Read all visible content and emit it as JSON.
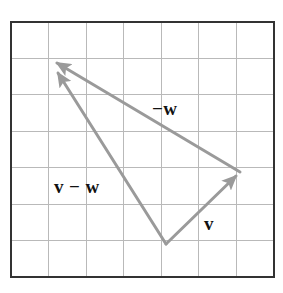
{
  "figure": {
    "background_color": "#ffffff"
  },
  "grid": {
    "x0": 11,
    "y0": 22,
    "x1": 274,
    "y1": 277,
    "columns": 7,
    "rows": 7,
    "border_color": "#333333",
    "border_width": 2,
    "line_color": "#b9b9b9",
    "line_width": 1,
    "fill_color": "#ffffff"
  },
  "vectors": {
    "color": "#9a9a9a",
    "line_width": 3,
    "items": [
      {
        "id": "v",
        "label": "v",
        "label_text": "v",
        "from": {
          "x": 166,
          "y": 244
        },
        "to": {
          "x": 240,
          "y": 172
        },
        "label_pos": {
          "x": 204,
          "y": 230
        }
      },
      {
        "id": "minus-w",
        "label": "−w",
        "label_text": "−w",
        "from": {
          "x": 240,
          "y": 172
        },
        "to": {
          "x": 52,
          "y": 60
        },
        "label_pos": {
          "x": 152,
          "y": 115
        }
      },
      {
        "id": "v-minus-w",
        "label": "v − w",
        "label_text": "v − w",
        "from": {
          "x": 166,
          "y": 244
        },
        "to": {
          "x": 54,
          "y": 69
        },
        "label_pos": {
          "x": 54,
          "y": 193
        }
      }
    ]
  },
  "labels": {
    "v": "v",
    "minus_w": "−w",
    "v_minus_w": "v − w"
  }
}
